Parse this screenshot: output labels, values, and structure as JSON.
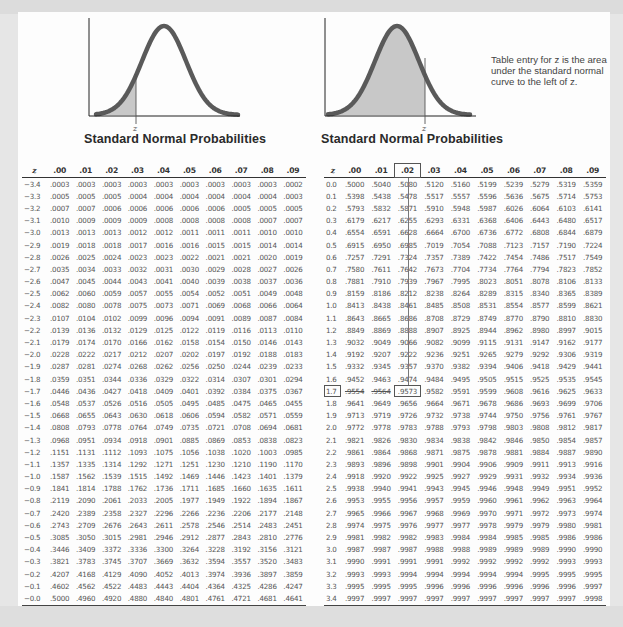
{
  "left_panel": {
    "title": "Standard Normal Probabilities",
    "graph_label": "z",
    "shade": "left tail (negative z)"
  },
  "right_panel": {
    "title": "Standard Normal Probabilities",
    "graph_label": "z",
    "note": "Table entry for z is the area under the standard normal curve to the left of z.",
    "highlight": {
      "row": "1.7",
      "column": ".02",
      "value": ".9573"
    }
  },
  "columns": [
    "z",
    ".00",
    ".01",
    ".02",
    ".03",
    ".04",
    ".05",
    ".06",
    ".07",
    ".08",
    ".09"
  ],
  "chart_data": {
    "type": "table",
    "title": "Standard Normal Probabilities",
    "columns": [
      "z",
      ".00",
      ".01",
      ".02",
      ".03",
      ".04",
      ".05",
      ".06",
      ".07",
      ".08",
      ".09"
    ],
    "negative_table": [
      [
        "−3.4",
        ".0003",
        ".0003",
        ".0003",
        ".0003",
        ".0003",
        ".0003",
        ".0003",
        ".0003",
        ".0003",
        ".0002"
      ],
      [
        "−3.3",
        ".0005",
        ".0005",
        ".0005",
        ".0004",
        ".0004",
        ".0004",
        ".0004",
        ".0004",
        ".0004",
        ".0003"
      ],
      [
        "−3.2",
        ".0007",
        ".0007",
        ".0006",
        ".0006",
        ".0006",
        ".0006",
        ".0006",
        ".0005",
        ".0005",
        ".0005"
      ],
      [
        "−3.1",
        ".0010",
        ".0009",
        ".0009",
        ".0009",
        ".0008",
        ".0008",
        ".0008",
        ".0008",
        ".0007",
        ".0007"
      ],
      [
        "−3.0",
        ".0013",
        ".0013",
        ".0013",
        ".0012",
        ".0012",
        ".0011",
        ".0011",
        ".0011",
        ".0010",
        ".0010"
      ],
      [
        "−2.9",
        ".0019",
        ".0018",
        ".0018",
        ".0017",
        ".0016",
        ".0016",
        ".0015",
        ".0015",
        ".0014",
        ".0014"
      ],
      [
        "−2.8",
        ".0026",
        ".0025",
        ".0024",
        ".0023",
        ".0023",
        ".0022",
        ".0021",
        ".0021",
        ".0020",
        ".0019"
      ],
      [
        "−2.7",
        ".0035",
        ".0034",
        ".0033",
        ".0032",
        ".0031",
        ".0030",
        ".0029",
        ".0028",
        ".0027",
        ".0026"
      ],
      [
        "−2.6",
        ".0047",
        ".0045",
        ".0044",
        ".0043",
        ".0041",
        ".0040",
        ".0039",
        ".0038",
        ".0037",
        ".0036"
      ],
      [
        "−2.5",
        ".0062",
        ".0060",
        ".0059",
        ".0057",
        ".0055",
        ".0054",
        ".0052",
        ".0051",
        ".0049",
        ".0048"
      ],
      [
        "−2.4",
        ".0082",
        ".0080",
        ".0078",
        ".0075",
        ".0073",
        ".0071",
        ".0069",
        ".0068",
        ".0066",
        ".0064"
      ],
      [
        "−2.3",
        ".0107",
        ".0104",
        ".0102",
        ".0099",
        ".0096",
        ".0094",
        ".0091",
        ".0089",
        ".0087",
        ".0084"
      ],
      [
        "−2.2",
        ".0139",
        ".0136",
        ".0132",
        ".0129",
        ".0125",
        ".0122",
        ".0119",
        ".0116",
        ".0113",
        ".0110"
      ],
      [
        "−2.1",
        ".0179",
        ".0174",
        ".0170",
        ".0166",
        ".0162",
        ".0158",
        ".0154",
        ".0150",
        ".0146",
        ".0143"
      ],
      [
        "−2.0",
        ".0228",
        ".0222",
        ".0217",
        ".0212",
        ".0207",
        ".0202",
        ".0197",
        ".0192",
        ".0188",
        ".0183"
      ],
      [
        "−1.9",
        ".0287",
        ".0281",
        ".0274",
        ".0268",
        ".0262",
        ".0256",
        ".0250",
        ".0244",
        ".0239",
        ".0233"
      ],
      [
        "−1.8",
        ".0359",
        ".0351",
        ".0344",
        ".0336",
        ".0329",
        ".0322",
        ".0314",
        ".0307",
        ".0301",
        ".0294"
      ],
      [
        "−1.7",
        ".0446",
        ".0436",
        ".0427",
        ".0418",
        ".0409",
        ".0401",
        ".0392",
        ".0384",
        ".0375",
        ".0367"
      ],
      [
        "−1.6",
        ".0548",
        ".0537",
        ".0526",
        ".0516",
        ".0505",
        ".0495",
        ".0485",
        ".0475",
        ".0465",
        ".0455"
      ],
      [
        "−1.5",
        ".0668",
        ".0655",
        ".0643",
        ".0630",
        ".0618",
        ".0606",
        ".0594",
        ".0582",
        ".0571",
        ".0559"
      ],
      [
        "−1.4",
        ".0808",
        ".0793",
        ".0778",
        ".0764",
        ".0749",
        ".0735",
        ".0721",
        ".0708",
        ".0694",
        ".0681"
      ],
      [
        "−1.3",
        ".0968",
        ".0951",
        ".0934",
        ".0918",
        ".0901",
        ".0885",
        ".0869",
        ".0853",
        ".0838",
        ".0823"
      ],
      [
        "−1.2",
        ".1151",
        ".1131",
        ".1112",
        ".1093",
        ".1075",
        ".1056",
        ".1038",
        ".1020",
        ".1003",
        ".0985"
      ],
      [
        "−1.1",
        ".1357",
        ".1335",
        ".1314",
        ".1292",
        ".1271",
        ".1251",
        ".1230",
        ".1210",
        ".1190",
        ".1170"
      ],
      [
        "−1.0",
        ".1587",
        ".1562",
        ".1539",
        ".1515",
        ".1492",
        ".1469",
        ".1446",
        ".1423",
        ".1401",
        ".1379"
      ],
      [
        "−0.9",
        ".1841",
        ".1814",
        ".1788",
        ".1762",
        ".1736",
        ".1711",
        ".1685",
        ".1660",
        ".1635",
        ".1611"
      ],
      [
        "−0.8",
        ".2119",
        ".2090",
        ".2061",
        ".2033",
        ".2005",
        ".1977",
        ".1949",
        ".1922",
        ".1894",
        ".1867"
      ],
      [
        "−0.7",
        ".2420",
        ".2389",
        ".2358",
        ".2327",
        ".2296",
        ".2266",
        ".2236",
        ".2206",
        ".2177",
        ".2148"
      ],
      [
        "−0.6",
        ".2743",
        ".2709",
        ".2676",
        ".2643",
        ".2611",
        ".2578",
        ".2546",
        ".2514",
        ".2483",
        ".2451"
      ],
      [
        "−0.5",
        ".3085",
        ".3050",
        ".3015",
        ".2981",
        ".2946",
        ".2912",
        ".2877",
        ".2843",
        ".2810",
        ".2776"
      ],
      [
        "−0.4",
        ".3446",
        ".3409",
        ".3372",
        ".3336",
        ".3300",
        ".3264",
        ".3228",
        ".3192",
        ".3156",
        ".3121"
      ],
      [
        "−0.3",
        ".3821",
        ".3783",
        ".3745",
        ".3707",
        ".3669",
        ".3632",
        ".3594",
        ".3557",
        ".3520",
        ".3483"
      ],
      [
        "−0.2",
        ".4207",
        ".4168",
        ".4129",
        ".4090",
        ".4052",
        ".4013",
        ".3974",
        ".3936",
        ".3897",
        ".3859"
      ],
      [
        "−0.1",
        ".4602",
        ".4562",
        ".4522",
        ".4483",
        ".4443",
        ".4404",
        ".4364",
        ".4325",
        ".4286",
        ".4247"
      ],
      [
        "−0.0",
        ".5000",
        ".4960",
        ".4920",
        ".4880",
        ".4840",
        ".4801",
        ".4761",
        ".4721",
        ".4681",
        ".4641"
      ]
    ],
    "positive_table": [
      [
        "0.0",
        ".5000",
        ".5040",
        ".5080",
        ".5120",
        ".5160",
        ".5199",
        ".5239",
        ".5279",
        ".5319",
        ".5359"
      ],
      [
        "0.1",
        ".5398",
        ".5438",
        ".5478",
        ".5517",
        ".5557",
        ".5596",
        ".5636",
        ".5675",
        ".5714",
        ".5753"
      ],
      [
        "0.2",
        ".5793",
        ".5832",
        ".5871",
        ".5910",
        ".5948",
        ".5987",
        ".6026",
        ".6064",
        ".6103",
        ".6141"
      ],
      [
        "0.3",
        ".6179",
        ".6217",
        ".6255",
        ".6293",
        ".6331",
        ".6368",
        ".6406",
        ".6443",
        ".6480",
        ".6517"
      ],
      [
        "0.4",
        ".6554",
        ".6591",
        ".6628",
        ".6664",
        ".6700",
        ".6736",
        ".6772",
        ".6808",
        ".6844",
        ".6879"
      ],
      [
        "0.5",
        ".6915",
        ".6950",
        ".6985",
        ".7019",
        ".7054",
        ".7088",
        ".7123",
        ".7157",
        ".7190",
        ".7224"
      ],
      [
        "0.6",
        ".7257",
        ".7291",
        ".7324",
        ".7357",
        ".7389",
        ".7422",
        ".7454",
        ".7486",
        ".7517",
        ".7549"
      ],
      [
        "0.7",
        ".7580",
        ".7611",
        ".7642",
        ".7673",
        ".7704",
        ".7734",
        ".7764",
        ".7794",
        ".7823",
        ".7852"
      ],
      [
        "0.8",
        ".7881",
        ".7910",
        ".7939",
        ".7967",
        ".7995",
        ".8023",
        ".8051",
        ".8078",
        ".8106",
        ".8133"
      ],
      [
        "0.9",
        ".8159",
        ".8186",
        ".8212",
        ".8238",
        ".8264",
        ".8289",
        ".8315",
        ".8340",
        ".8365",
        ".8389"
      ],
      [
        "1.0",
        ".8413",
        ".8438",
        ".8461",
        ".8485",
        ".8508",
        ".8531",
        ".8554",
        ".8577",
        ".8599",
        ".8621"
      ],
      [
        "1.1",
        ".8643",
        ".8665",
        ".8686",
        ".8708",
        ".8729",
        ".8749",
        ".8770",
        ".8790",
        ".8810",
        ".8830"
      ],
      [
        "1.2",
        ".8849",
        ".8869",
        ".8888",
        ".8907",
        ".8925",
        ".8944",
        ".8962",
        ".8980",
        ".8997",
        ".9015"
      ],
      [
        "1.3",
        ".9032",
        ".9049",
        ".9066",
        ".9082",
        ".9099",
        ".9115",
        ".9131",
        ".9147",
        ".9162",
        ".9177"
      ],
      [
        "1.4",
        ".9192",
        ".9207",
        ".9222",
        ".9236",
        ".9251",
        ".9265",
        ".9279",
        ".9292",
        ".9306",
        ".9319"
      ],
      [
        "1.5",
        ".9332",
        ".9345",
        ".9357",
        ".9370",
        ".9382",
        ".9394",
        ".9406",
        ".9418",
        ".9429",
        ".9441"
      ],
      [
        "1.6",
        ".9452",
        ".9463",
        ".9474",
        ".9484",
        ".9495",
        ".9505",
        ".9515",
        ".9525",
        ".9535",
        ".9545"
      ],
      [
        "1.7",
        ".9554",
        ".9564",
        ".9573",
        ".9582",
        ".9591",
        ".9599",
        ".9608",
        ".9616",
        ".9625",
        ".9633"
      ],
      [
        "1.8",
        ".9641",
        ".9649",
        ".9656",
        ".9664",
        ".9671",
        ".9678",
        ".9686",
        ".9693",
        ".9699",
        ".9706"
      ],
      [
        "1.9",
        ".9713",
        ".9719",
        ".9726",
        ".9732",
        ".9738",
        ".9744",
        ".9750",
        ".9756",
        ".9761",
        ".9767"
      ],
      [
        "2.0",
        ".9772",
        ".9778",
        ".9783",
        ".9788",
        ".9793",
        ".9798",
        ".9803",
        ".9808",
        ".9812",
        ".9817"
      ],
      [
        "2.1",
        ".9821",
        ".9826",
        ".9830",
        ".9834",
        ".9838",
        ".9842",
        ".9846",
        ".9850",
        ".9854",
        ".9857"
      ],
      [
        "2.2",
        ".9861",
        ".9864",
        ".9868",
        ".9871",
        ".9875",
        ".9878",
        ".9881",
        ".9884",
        ".9887",
        ".9890"
      ],
      [
        "2.3",
        ".9893",
        ".9896",
        ".9898",
        ".9901",
        ".9904",
        ".9906",
        ".9909",
        ".9911",
        ".9913",
        ".9916"
      ],
      [
        "2.4",
        ".9918",
        ".9920",
        ".9922",
        ".9925",
        ".9927",
        ".9929",
        ".9931",
        ".9932",
        ".9934",
        ".9936"
      ],
      [
        "2.5",
        ".9938",
        ".9940",
        ".9941",
        ".9943",
        ".9945",
        ".9946",
        ".9948",
        ".9949",
        ".9951",
        ".9952"
      ],
      [
        "2.6",
        ".9953",
        ".9955",
        ".9956",
        ".9957",
        ".9959",
        ".9960",
        ".9961",
        ".9962",
        ".9963",
        ".9964"
      ],
      [
        "2.7",
        ".9965",
        ".9966",
        ".9967",
        ".9968",
        ".9969",
        ".9970",
        ".9971",
        ".9972",
        ".9973",
        ".9974"
      ],
      [
        "2.8",
        ".9974",
        ".9975",
        ".9976",
        ".9977",
        ".9977",
        ".9978",
        ".9979",
        ".9979",
        ".9980",
        ".9981"
      ],
      [
        "2.9",
        ".9981",
        ".9982",
        ".9982",
        ".9983",
        ".9984",
        ".9984",
        ".9985",
        ".9985",
        ".9986",
        ".9986"
      ],
      [
        "3.0",
        ".9987",
        ".9987",
        ".9987",
        ".9988",
        ".9988",
        ".9989",
        ".9989",
        ".9989",
        ".9990",
        ".9990"
      ],
      [
        "3.1",
        ".9990",
        ".9991",
        ".9991",
        ".9991",
        ".9992",
        ".9992",
        ".9992",
        ".9992",
        ".9993",
        ".9993"
      ],
      [
        "3.2",
        ".9993",
        ".9993",
        ".9994",
        ".9994",
        ".9994",
        ".9994",
        ".9994",
        ".9995",
        ".9995",
        ".9995"
      ],
      [
        "3.3",
        ".9995",
        ".9995",
        ".9995",
        ".9996",
        ".9996",
        ".9996",
        ".9996",
        ".9996",
        ".9996",
        ".9997"
      ],
      [
        "3.4",
        ".9997",
        ".9997",
        ".9997",
        ".9997",
        ".9997",
        ".9997",
        ".9997",
        ".9997",
        ".9997",
        ".9998"
      ]
    ]
  }
}
